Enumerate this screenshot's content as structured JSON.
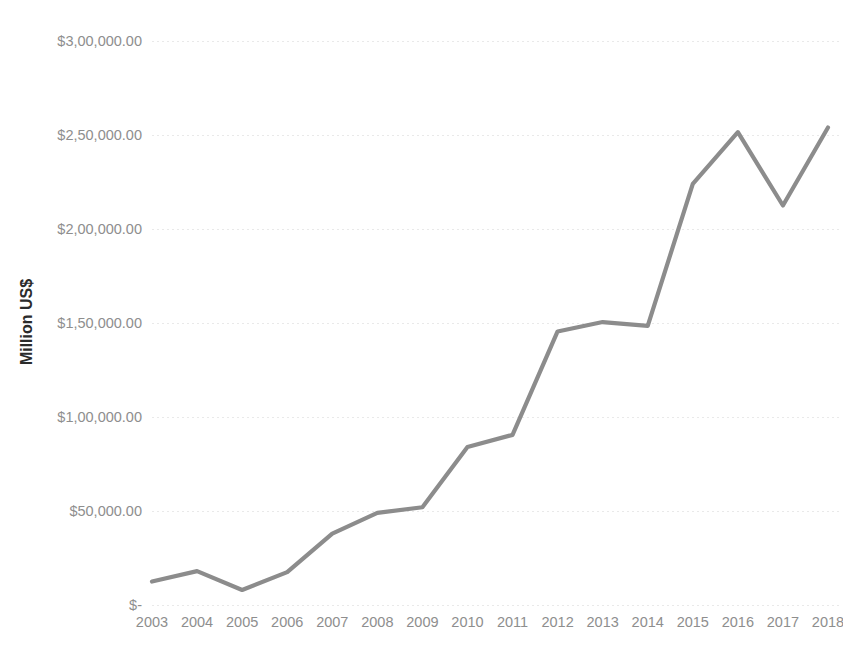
{
  "chart_data": {
    "type": "line",
    "title": "",
    "subtitle": "",
    "xlabel": "",
    "ylabel": "Million US$",
    "categories": [
      "2003",
      "2004",
      "2005",
      "2006",
      "2007",
      "2008",
      "2009",
      "2010",
      "2011",
      "2012",
      "2013",
      "2014",
      "2015",
      "2016",
      "2017",
      "2018"
    ],
    "series": [
      {
        "name": "Million US$",
        "color": "#8c8c8c",
        "values": [
          12500,
          18000,
          8000,
          17500,
          38000,
          49000,
          52000,
          84000,
          90500,
          145500,
          150500,
          148500,
          224000,
          251500,
          212500,
          254000
        ]
      }
    ],
    "ylim": [
      0,
      300000
    ],
    "yticks": [
      0,
      50000,
      100000,
      150000,
      200000,
      250000,
      300000
    ],
    "ytick_labels": [
      "$-",
      "$50,000.00",
      "$1,00,000.00",
      "$1,50,000.00",
      "$2,00,000.00",
      "$2,50,000.00",
      "$3,00,000.00"
    ],
    "xtick_labels": [
      "2003",
      "2004",
      "2005",
      "2006",
      "2007",
      "2008",
      "2009",
      "2010",
      "2011",
      "2012",
      "2013",
      "2014",
      "2015",
      "2016",
      "2017",
      "2018"
    ],
    "grid": true,
    "grid_axis": "y",
    "grid_color": "#e9e9e9",
    "legend": false,
    "legend_position": "none",
    "background_color": "#ffffff",
    "axis_label_color": "#8e8e8e",
    "axis_title_color": "#2b2b2b",
    "number_format": "indian-grouping"
  },
  "layout": {
    "plot_left": 152,
    "plot_right": 828,
    "plot_top": 41,
    "plot_bottom": 605,
    "ylabel_x": 32,
    "ylabel_y": 322,
    "xlabel_row_y": 627
  }
}
